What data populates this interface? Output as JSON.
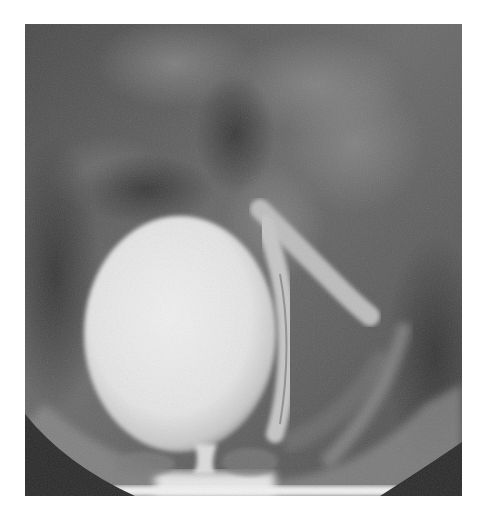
{
  "image": {
    "kind": "fluoroscopic-xray",
    "description": "Grayscale radiograph showing a large contrast-filled rounded bladder with a tubular contrast-filled structure curving along its right side",
    "colors": {
      "background": "#ffffff",
      "film_base": "#5a5a5a",
      "dark_soft_tissue": "#3e3e3e",
      "mid_tissue": "#727272",
      "bright_contrast": "#ececec",
      "tube_contrast": "#c4c4c4",
      "collimator_corner": "#2a2a2a"
    }
  }
}
